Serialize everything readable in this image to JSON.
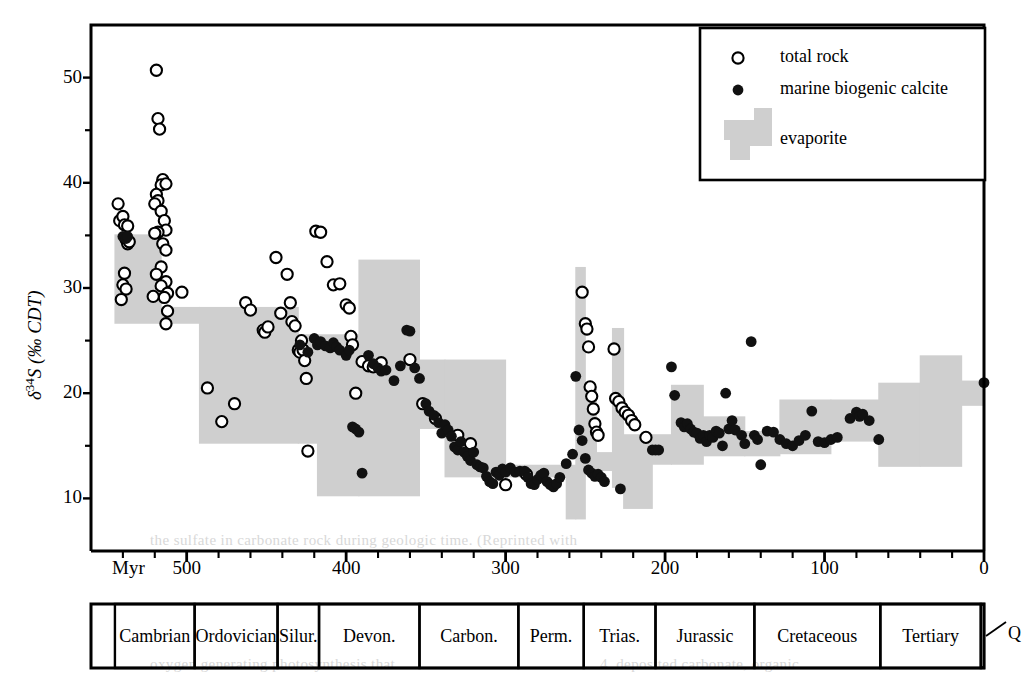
{
  "figure": {
    "ylabel": "δ 34S (‰ CDT)",
    "ylabel_parts": {
      "delta": "δ",
      "sup": "34",
      "rest": "S (‰ CDT)"
    },
    "xlabel": "Myr"
  },
  "legend": {
    "items": [
      {
        "label": "total rock",
        "marker": "open-circle"
      },
      {
        "label": "marine biogenic calcite",
        "marker": "filled-circle"
      },
      {
        "label": "evaporite",
        "marker": "gray-band-swatch"
      }
    ]
  },
  "timescale": {
    "periods": [
      {
        "label": "Cambrian",
        "start": 545,
        "end": 495
      },
      {
        "label": "Ordovician",
        "start": 495,
        "end": 443
      },
      {
        "label": "Silur.",
        "start": 443,
        "end": 417
      },
      {
        "label": "Devon.",
        "start": 417,
        "end": 354
      },
      {
        "label": "Carbon.",
        "start": 354,
        "end": 292
      },
      {
        "label": "Perm.",
        "start": 292,
        "end": 251
      },
      {
        "label": "Trias.",
        "start": 251,
        "end": 206
      },
      {
        "label": "Jurassic",
        "start": 206,
        "end": 144
      },
      {
        "label": "Cretaceous",
        "start": 144,
        "end": 65
      },
      {
        "label": "Tertiary",
        "start": 65,
        "end": 2
      },
      {
        "label": "Q",
        "start": 2,
        "end": 0,
        "callout": true
      }
    ]
  },
  "chart_data": {
    "type": "scatter",
    "title": "",
    "xlabel": "Myr",
    "ylabel": "δ 34S (‰ CDT)",
    "xlim": [
      560,
      0
    ],
    "ylim": [
      5,
      55
    ],
    "x_reversed": true,
    "xticks": [
      500,
      400,
      300,
      200,
      100,
      0
    ],
    "xtick_labels": [
      "500",
      "400",
      "300",
      "200",
      "100",
      "0"
    ],
    "xminor_step": 20,
    "yticks": [
      10,
      20,
      30,
      40,
      50
    ],
    "ytick_labels": [
      "10",
      "20",
      "30",
      "40",
      "50"
    ],
    "yminor": [
      15,
      25,
      35,
      45
    ],
    "grid": false,
    "legend_position": "top-right",
    "colors": {
      "evaporite_band": "#cfcfcf",
      "marker_stroke": "#000000",
      "axis": "#000000"
    },
    "series": [
      {
        "name": "total rock",
        "marker": "open-circle",
        "points": [
          [
            543,
            38.0
          ],
          [
            542,
            36.4
          ],
          [
            540,
            36.8
          ],
          [
            539,
            36.0
          ],
          [
            537,
            35.9
          ],
          [
            538,
            34.6
          ],
          [
            537,
            34.2
          ],
          [
            536,
            34.4
          ],
          [
            539,
            31.4
          ],
          [
            540,
            30.3
          ],
          [
            538,
            29.9
          ],
          [
            541,
            28.9
          ],
          [
            519,
            50.7
          ],
          [
            518,
            46.1
          ],
          [
            517,
            45.1
          ],
          [
            515,
            40.3
          ],
          [
            516,
            39.8
          ],
          [
            513,
            39.9
          ],
          [
            519,
            38.9
          ],
          [
            518,
            38.3
          ],
          [
            520,
            38.0
          ],
          [
            516,
            37.3
          ],
          [
            514,
            36.4
          ],
          [
            513,
            35.5
          ],
          [
            518,
            35.3
          ],
          [
            520,
            35.2
          ],
          [
            515,
            34.2
          ],
          [
            513,
            33.6
          ],
          [
            516,
            32.0
          ],
          [
            519,
            31.3
          ],
          [
            513,
            30.6
          ],
          [
            516,
            30.2
          ],
          [
            512,
            29.5
          ],
          [
            514,
            29.1
          ],
          [
            521,
            29.2
          ],
          [
            512,
            27.8
          ],
          [
            513,
            26.6
          ],
          [
            503,
            29.6
          ],
          [
            487,
            20.5
          ],
          [
            478,
            17.3
          ],
          [
            470,
            19.0
          ],
          [
            463,
            28.6
          ],
          [
            460,
            27.9
          ],
          [
            452,
            26.0
          ],
          [
            451,
            25.8
          ],
          [
            449,
            26.3
          ],
          [
            444,
            32.9
          ],
          [
            441,
            27.6
          ],
          [
            437,
            31.3
          ],
          [
            435,
            28.6
          ],
          [
            434,
            26.8
          ],
          [
            432,
            26.4
          ],
          [
            430,
            24.1
          ],
          [
            429,
            23.9
          ],
          [
            428,
            25.0
          ],
          [
            427,
            24.1
          ],
          [
            426,
            23.1
          ],
          [
            425,
            21.4
          ],
          [
            424,
            14.5
          ],
          [
            419,
            35.4
          ],
          [
            416,
            35.3
          ],
          [
            412,
            32.5
          ],
          [
            408,
            30.3
          ],
          [
            404,
            30.4
          ],
          [
            400,
            28.4
          ],
          [
            398,
            28.1
          ],
          [
            397,
            25.4
          ],
          [
            396,
            24.6
          ],
          [
            394,
            20.0
          ],
          [
            390,
            23.0
          ],
          [
            386,
            22.6
          ],
          [
            383,
            22.5
          ],
          [
            378,
            22.9
          ],
          [
            360,
            23.2
          ],
          [
            352,
            19.0
          ],
          [
            344,
            17.6
          ],
          [
            330,
            16.0
          ],
          [
            322,
            15.2
          ],
          [
            300,
            11.3
          ],
          [
            287,
            12.3
          ],
          [
            252,
            29.6
          ],
          [
            250,
            26.6
          ],
          [
            249,
            26.1
          ],
          [
            248,
            24.4
          ],
          [
            247,
            20.6
          ],
          [
            246,
            19.7
          ],
          [
            245,
            18.5
          ],
          [
            244,
            17.1
          ],
          [
            243,
            16.3
          ],
          [
            242,
            16.0
          ],
          [
            232,
            24.2
          ],
          [
            231,
            19.5
          ],
          [
            229,
            19.2
          ],
          [
            227,
            18.6
          ],
          [
            225,
            18.2
          ],
          [
            223,
            17.9
          ],
          [
            221,
            17.4
          ],
          [
            219,
            17.0
          ],
          [
            212,
            15.8
          ]
        ]
      },
      {
        "name": "marine biogenic calcite",
        "marker": "filled-circle",
        "points": [
          [
            540,
            34.9
          ],
          [
            538,
            34.7
          ],
          [
            537,
            34.9
          ],
          [
            429,
            24.6
          ],
          [
            424,
            23.9
          ],
          [
            420,
            25.2
          ],
          [
            418,
            24.6
          ],
          [
            416,
            24.9
          ],
          [
            413,
            24.5
          ],
          [
            410,
            24.3
          ],
          [
            408,
            24.8
          ],
          [
            406,
            24.4
          ],
          [
            404,
            24.1
          ],
          [
            400,
            23.6
          ],
          [
            398,
            24.1
          ],
          [
            396,
            16.8
          ],
          [
            394,
            16.6
          ],
          [
            392,
            16.3
          ],
          [
            390,
            12.4
          ],
          [
            386,
            23.6
          ],
          [
            383,
            22.8
          ],
          [
            380,
            22.4
          ],
          [
            378,
            22.1
          ],
          [
            375,
            22.2
          ],
          [
            370,
            21.2
          ],
          [
            366,
            22.6
          ],
          [
            362,
            26.0
          ],
          [
            360,
            25.9
          ],
          [
            357,
            22.4
          ],
          [
            354,
            21.4
          ],
          [
            350,
            19.0
          ],
          [
            348,
            18.3
          ],
          [
            345,
            17.9
          ],
          [
            342,
            17.2
          ],
          [
            340,
            16.2
          ],
          [
            338,
            17.0
          ],
          [
            336,
            16.5
          ],
          [
            334,
            15.9
          ],
          [
            332,
            14.9
          ],
          [
            330,
            14.6
          ],
          [
            328,
            15.4
          ],
          [
            326,
            14.4
          ],
          [
            324,
            14.0
          ],
          [
            322,
            13.6
          ],
          [
            320,
            14.4
          ],
          [
            318,
            13.2
          ],
          [
            316,
            13.0
          ],
          [
            314,
            12.9
          ],
          [
            312,
            12.1
          ],
          [
            310,
            11.6
          ],
          [
            308,
            11.4
          ],
          [
            306,
            12.5
          ],
          [
            304,
            12.2
          ],
          [
            302,
            12.8
          ],
          [
            300,
            12.5
          ],
          [
            297,
            12.9
          ],
          [
            294,
            12.5
          ],
          [
            291,
            12.6
          ],
          [
            288,
            12.6
          ],
          [
            286,
            12.0
          ],
          [
            284,
            11.4
          ],
          [
            282,
            11.3
          ],
          [
            280,
            11.8
          ],
          [
            278,
            12.2
          ],
          [
            276,
            12.4
          ],
          [
            274,
            11.6
          ],
          [
            272,
            11.3
          ],
          [
            270,
            11.1
          ],
          [
            268,
            11.4
          ],
          [
            266,
            12.0
          ],
          [
            262,
            13.3
          ],
          [
            258,
            14.2
          ],
          [
            256,
            21.6
          ],
          [
            254,
            16.5
          ],
          [
            252,
            15.5
          ],
          [
            250,
            13.8
          ],
          [
            248,
            12.7
          ],
          [
            246,
            12.4
          ],
          [
            244,
            12.1
          ],
          [
            242,
            12.3
          ],
          [
            240,
            12.0
          ],
          [
            238,
            11.6
          ],
          [
            228,
            10.9
          ],
          [
            208,
            14.6
          ],
          [
            206,
            14.6
          ],
          [
            204,
            14.6
          ],
          [
            196,
            22.5
          ],
          [
            194,
            19.8
          ],
          [
            190,
            17.2
          ],
          [
            188,
            16.8
          ],
          [
            186,
            17.1
          ],
          [
            184,
            16.6
          ],
          [
            182,
            16.3
          ],
          [
            180,
            16.2
          ],
          [
            178,
            15.7
          ],
          [
            176,
            16.0
          ],
          [
            174,
            15.4
          ],
          [
            172,
            16.0
          ],
          [
            170,
            15.8
          ],
          [
            168,
            16.4
          ],
          [
            166,
            16.2
          ],
          [
            164,
            15.0
          ],
          [
            162,
            20.0
          ],
          [
            160,
            16.6
          ],
          [
            158,
            17.4
          ],
          [
            156,
            16.5
          ],
          [
            152,
            16.0
          ],
          [
            150,
            15.2
          ],
          [
            146,
            24.9
          ],
          [
            144,
            16.0
          ],
          [
            142,
            15.6
          ],
          [
            140,
            13.2
          ],
          [
            136,
            16.4
          ],
          [
            132,
            16.3
          ],
          [
            128,
            15.6
          ],
          [
            124,
            15.2
          ],
          [
            120,
            15.0
          ],
          [
            116,
            15.5
          ],
          [
            112,
            16.0
          ],
          [
            108,
            18.3
          ],
          [
            104,
            15.4
          ],
          [
            100,
            15.3
          ],
          [
            96,
            15.6
          ],
          [
            92,
            15.8
          ],
          [
            84,
            17.6
          ],
          [
            80,
            18.2
          ],
          [
            78,
            17.8
          ],
          [
            76,
            18.0
          ],
          [
            72,
            17.4
          ],
          [
            66,
            15.6
          ],
          [
            0,
            21.0
          ]
        ]
      }
    ],
    "evaporite_band": {
      "name": "evaporite",
      "description": "Stepped gray band of evaporite sulfate ranges through the Phanerozoic",
      "blocks": [
        {
          "x_start": 545,
          "x_end": 516,
          "low": 26.6,
          "high": 35.1
        },
        {
          "x_start": 516,
          "x_end": 492,
          "low": 26.6,
          "high": 28.2
        },
        {
          "x_start": 492,
          "x_end": 430,
          "low": 15.2,
          "high": 28.2
        },
        {
          "x_start": 430,
          "x_end": 418,
          "low": 15.2,
          "high": 25.6
        },
        {
          "x_start": 418,
          "x_end": 392,
          "low": 10.2,
          "high": 25.6
        },
        {
          "x_start": 392,
          "x_end": 354,
          "low": 10.2,
          "high": 32.7
        },
        {
          "x_start": 354,
          "x_end": 338,
          "low": 16.6,
          "high": 23.2
        },
        {
          "x_start": 338,
          "x_end": 300,
          "low": 12.0,
          "high": 23.2
        },
        {
          "x_start": 300,
          "x_end": 262,
          "low": 12.0,
          "high": 13.2
        },
        {
          "x_start": 262,
          "x_end": 256,
          "low": 8.0,
          "high": 13.2
        },
        {
          "x_start": 256,
          "x_end": 250,
          "low": 8.0,
          "high": 32.0
        },
        {
          "x_start": 250,
          "x_end": 243,
          "low": 12.6,
          "high": 20.6
        },
        {
          "x_start": 243,
          "x_end": 233,
          "low": 12.6,
          "high": 14.4
        },
        {
          "x_start": 233,
          "x_end": 226,
          "low": 11.0,
          "high": 26.2
        },
        {
          "x_start": 226,
          "x_end": 208,
          "low": 9.0,
          "high": 16.1
        },
        {
          "x_start": 208,
          "x_end": 196,
          "low": 13.2,
          "high": 16.1
        },
        {
          "x_start": 196,
          "x_end": 176,
          "low": 13.2,
          "high": 20.8
        },
        {
          "x_start": 176,
          "x_end": 150,
          "low": 14.0,
          "high": 17.8
        },
        {
          "x_start": 150,
          "x_end": 128,
          "low": 14.0,
          "high": 16.4
        },
        {
          "x_start": 128,
          "x_end": 96,
          "low": 14.2,
          "high": 19.4
        },
        {
          "x_start": 96,
          "x_end": 66,
          "low": 15.4,
          "high": 19.4
        },
        {
          "x_start": 66,
          "x_end": 40,
          "low": 13.0,
          "high": 21.0
        },
        {
          "x_start": 40,
          "x_end": 14,
          "low": 13.0,
          "high": 23.6
        },
        {
          "x_start": 14,
          "x_end": 0,
          "low": 18.8,
          "high": 21.2
        }
      ]
    }
  },
  "background_text": {
    "lines": [
      {
        "text": "the sulfate in carbonate rock during geologic time. (Reprinted with",
        "x": 150,
        "y": 540
      },
      {
        "text": "oxygen generating photosynthesis that",
        "x": 300,
        "y": 660
      },
      {
        "text": "4. deposited carbonate, organic",
        "x": 620,
        "y": 660
      }
    ]
  }
}
